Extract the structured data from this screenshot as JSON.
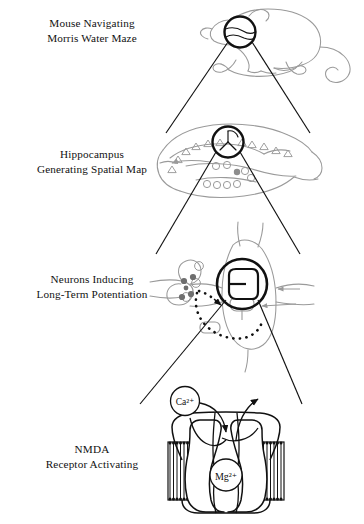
{
  "figure": {
    "title_visible": false,
    "type": "multi-level magnification diagram",
    "background_color": "#ffffff",
    "ink_color": "#111111",
    "outline_gray": "#9a9a9a",
    "mid_gray": "#8d8d8d",
    "dark_gray_dot": "#6e6e6e"
  },
  "panels": [
    {
      "id": "mouse",
      "label_line1": "Mouse Navigating",
      "label_line2": "Morris Water Maze",
      "subject": "mouse-outline",
      "focus_circle": "head-region"
    },
    {
      "id": "hippocampus",
      "label_line1": "Hippocampus",
      "label_line2": "Generating Spatial Map",
      "subject": "brain-sagittal-outline",
      "focus_circle": "hippocampal-neuron"
    },
    {
      "id": "neurons",
      "label_line1": "Neurons Inducing",
      "label_line2": "Long-Term Potentiation",
      "subject": "synapse-outline",
      "focus_circle": "postsynaptic-receptor"
    },
    {
      "id": "nmda",
      "label_line1": "NMDA",
      "label_line2": "Receptor Activating",
      "subject": "nmda-receptor-channel",
      "focus_circle": null
    }
  ],
  "ion_labels": {
    "calcium": "Ca²⁺",
    "magnesium": "Mg²⁺"
  }
}
